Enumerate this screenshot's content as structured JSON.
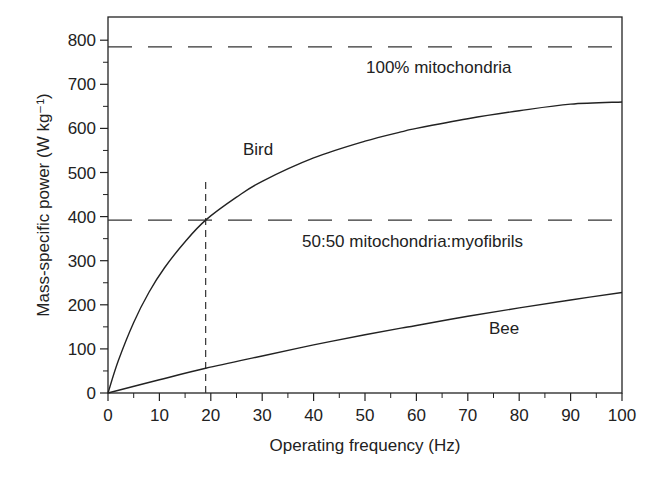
{
  "chart_data": {
    "type": "line",
    "title": "",
    "xlabel": "Operating frequency (Hz)",
    "ylabel": "Mass-specific power (W kg⁻¹)",
    "xlim": [
      0,
      100
    ],
    "ylim": [
      0,
      850
    ],
    "xticks": [
      0,
      10,
      20,
      30,
      40,
      50,
      60,
      70,
      80,
      90,
      100
    ],
    "yticks": [
      0,
      100,
      200,
      300,
      400,
      500,
      600,
      700,
      800
    ],
    "grid": false,
    "legend": "none",
    "series": [
      {
        "name": "Bird",
        "label": "Bird",
        "x": [
          0,
          2,
          5,
          8,
          11,
          15,
          19,
          25,
          30,
          40,
          50,
          57,
          60,
          70,
          80,
          90,
          100
        ],
        "y": [
          0,
          73,
          160,
          229,
          284,
          343,
          392,
          444,
          480,
          533,
          571,
          592,
          600,
          622,
          640,
          655,
          660
        ]
      },
      {
        "name": "Bee",
        "label": "Bee",
        "x": [
          0,
          10,
          19,
          30,
          40,
          50,
          57,
          60,
          70,
          80,
          90,
          100
        ],
        "y": [
          0,
          30,
          56,
          84,
          109,
          132,
          147,
          153,
          174,
          193,
          211,
          228
        ]
      }
    ],
    "reference_lines": [
      {
        "orientation": "horizontal",
        "value": 785,
        "style": "dashed",
        "label": "100% mitochondria"
      },
      {
        "orientation": "horizontal",
        "value": 392,
        "style": "dashed",
        "label": "50:50 mitochondria:myofibrils"
      },
      {
        "orientation": "vertical",
        "value": 19,
        "range": [
          0,
          485
        ],
        "style": "dashed",
        "label": ""
      }
    ]
  }
}
